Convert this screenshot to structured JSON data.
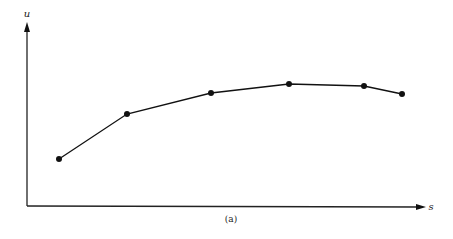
{
  "chart_data": {
    "type": "line",
    "title": "",
    "caption": "(a)",
    "xlabel": "s",
    "ylabel": "u",
    "grid": false,
    "legend": null,
    "axis_ticks": false,
    "x": [
      1,
      2,
      3,
      4,
      5,
      6
    ],
    "series": [
      {
        "name": "u(s)",
        "values": [
          0.28,
          0.57,
          0.71,
          0.77,
          0.76,
          0.7
        ],
        "markers": true,
        "color": "#111111"
      }
    ],
    "pixel_points": [
      [
        59,
        159
      ],
      [
        127,
        114
      ],
      [
        211,
        93
      ],
      [
        289,
        84
      ],
      [
        364,
        86
      ],
      [
        402,
        94
      ]
    ],
    "xlim": [
      0,
      7
    ],
    "ylim": [
      0,
      1
    ]
  },
  "labels": {
    "x_axis": "s",
    "y_axis": "u",
    "caption": "(a)"
  }
}
